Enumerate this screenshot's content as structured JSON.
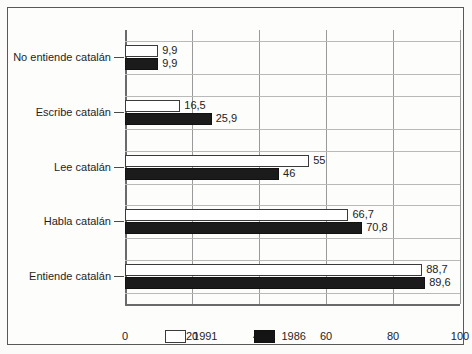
{
  "chart_data": {
    "type": "bar",
    "orientation": "horizontal",
    "title": "",
    "xlabel": "",
    "ylabel": "",
    "xlim": [
      0,
      100
    ],
    "grid": true,
    "legend_position": "bottom",
    "categories": [
      "No entiende catalán",
      "Escribe catalán",
      "Lee catalán",
      "Habla catalán",
      "Entiende catalán"
    ],
    "xticks": [
      "0",
      "20",
      "40",
      "60",
      "80",
      "100"
    ],
    "xtick_values": [
      0,
      20,
      40,
      60,
      80,
      100
    ],
    "series": [
      {
        "name": "1991",
        "color": "#ffffff",
        "values": [
          9.9,
          16.5,
          55,
          66.7,
          88.7
        ],
        "labels": [
          "9,9",
          "16,5",
          "55",
          "66,7",
          "88,7"
        ]
      },
      {
        "name": "1986",
        "color": "#141414",
        "values": [
          9.9,
          25.9,
          46,
          70.8,
          89.6
        ],
        "labels": [
          "9,9",
          "25,9",
          "46",
          "70,8",
          "89,6"
        ]
      }
    ]
  },
  "legend": {
    "items": [
      {
        "label": "1991"
      },
      {
        "label": "1986"
      }
    ]
  }
}
